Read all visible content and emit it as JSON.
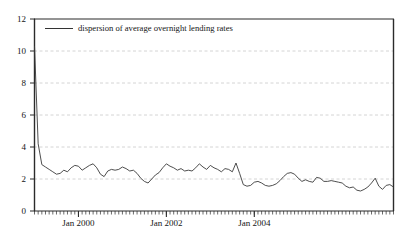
{
  "chart_data": {
    "type": "line",
    "title": "",
    "subtitle": "",
    "xlabel": "",
    "ylabel": "",
    "ylim": [
      0,
      12
    ],
    "yticks": [
      0,
      2,
      4,
      6,
      8,
      10,
      12
    ],
    "ytick_labels": [
      "0",
      "2",
      "4",
      "6",
      "8",
      "10",
      "12"
    ],
    "xlim": [
      "1999-01",
      "2006-04"
    ],
    "xtick_labels": [
      "Jan 2000",
      "Jan 2002",
      "Jan 2004"
    ],
    "xtick_values": [
      "2000-01",
      "2002-01",
      "2004-01"
    ],
    "minor_xticks": "monthly",
    "grid": {
      "y": true,
      "x": false,
      "style": "dashed",
      "color": "#c8c8c8"
    },
    "legend": {
      "position": "top-left-inside",
      "entries": [
        {
          "label": "dispersion of average overnight lending rates",
          "color": "#333333"
        }
      ]
    },
    "series": [
      {
        "name": "dispersion of average overnight lending rates",
        "color": "#333333",
        "x": [
          "1999-01",
          "1999-02",
          "1999-03",
          "1999-04",
          "1999-05",
          "1999-06",
          "1999-07",
          "1999-08",
          "1999-09",
          "1999-10",
          "1999-11",
          "1999-12",
          "2000-01",
          "2000-02",
          "2000-03",
          "2000-04",
          "2000-05",
          "2000-06",
          "2000-07",
          "2000-08",
          "2000-09",
          "2000-10",
          "2000-11",
          "2000-12",
          "2001-01",
          "2001-02",
          "2001-03",
          "2001-04",
          "2001-05",
          "2001-06",
          "2001-07",
          "2001-08",
          "2001-09",
          "2001-10",
          "2001-11",
          "2001-12",
          "2002-01",
          "2002-02",
          "2002-03",
          "2002-04",
          "2002-05",
          "2002-06",
          "2002-07",
          "2002-08",
          "2002-09",
          "2002-10",
          "2002-11",
          "2002-12",
          "2003-01",
          "2003-02",
          "2003-03",
          "2003-04",
          "2003-05",
          "2003-06",
          "2003-07",
          "2003-08",
          "2003-09",
          "2003-10",
          "2003-11",
          "2003-12",
          "2004-01",
          "2004-02",
          "2004-03",
          "2004-04",
          "2004-05",
          "2004-06",
          "2004-07",
          "2004-08",
          "2004-09",
          "2004-10",
          "2004-11",
          "2004-12",
          "2005-01",
          "2005-02",
          "2005-03",
          "2005-04",
          "2005-05",
          "2005-06",
          "2005-07",
          "2005-08",
          "2005-09",
          "2005-10",
          "2005-11",
          "2005-12",
          "2006-01",
          "2006-02",
          "2006-03",
          "2006-04"
        ],
        "values": [
          10.3,
          4.2,
          2.9,
          2.75,
          2.6,
          2.45,
          2.3,
          2.35,
          2.55,
          2.45,
          2.7,
          2.85,
          2.8,
          2.55,
          2.7,
          2.85,
          2.95,
          2.7,
          2.3,
          2.15,
          2.5,
          2.6,
          2.55,
          2.6,
          2.75,
          2.65,
          2.5,
          2.55,
          2.35,
          2.05,
          1.85,
          1.75,
          2.0,
          2.25,
          2.4,
          2.7,
          2.95,
          2.8,
          2.7,
          2.55,
          2.65,
          2.5,
          2.55,
          2.5,
          2.7,
          2.95,
          2.75,
          2.6,
          2.85,
          2.7,
          2.6,
          2.45,
          2.65,
          2.6,
          2.45,
          3.0,
          2.35,
          1.65,
          1.55,
          1.6,
          1.8,
          1.85,
          1.75,
          1.6,
          1.55,
          1.6,
          1.7,
          1.9,
          2.15,
          2.35,
          2.4,
          2.3,
          2.05,
          1.85,
          1.95,
          1.85,
          1.8,
          2.1,
          2.05,
          1.85,
          1.85,
          1.9,
          1.85,
          1.8,
          1.75,
          1.55,
          1.45,
          1.5
        ]
      }
    ],
    "extra_values": [
      1.3,
      1.25,
      1.35,
      1.5,
      1.75,
      2.05,
      1.55,
      1.35,
      1.6,
      1.65,
      1.5
    ]
  },
  "axis": {
    "ytick_labels": [
      "12",
      "10",
      "8",
      "6",
      "4",
      "2",
      "0"
    ],
    "xtick_labels": [
      "Jan 2000",
      "Jan 2002",
      "Jan 2004"
    ]
  },
  "legend": {
    "label": "dispersion of average overnight lending rates"
  }
}
